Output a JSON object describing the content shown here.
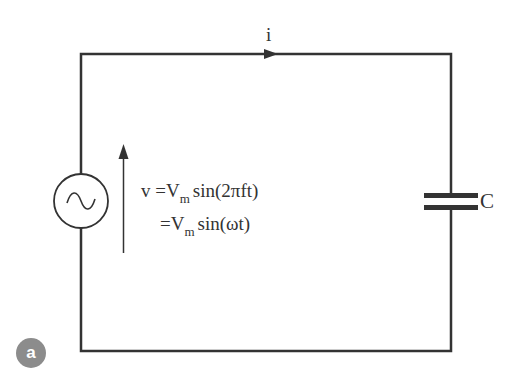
{
  "figure": {
    "badge_label": "a",
    "current_label": "i",
    "capacitor_label": "C",
    "equation": {
      "line1": {
        "lhs": "v",
        "eq": "=",
        "var": "V",
        "sub": "m",
        "rhs": "sin(2πft)"
      },
      "line2": {
        "eq": "=",
        "var": "V",
        "sub": "m",
        "rhs": "sin(ωt)"
      }
    },
    "components": [
      {
        "type": "ac-voltage-source",
        "symbol": "~"
      },
      {
        "type": "capacitor",
        "label": "C"
      },
      {
        "type": "current-arrow",
        "label": "i",
        "direction": "right"
      },
      {
        "type": "voltage-arrow",
        "direction": "up"
      }
    ],
    "colors": {
      "wire": "#333333",
      "text": "#333333",
      "badge": "#8c8c8c"
    }
  }
}
